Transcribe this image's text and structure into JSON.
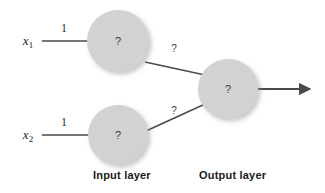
{
  "diagram": {
    "type": "neural-network",
    "background_color": "#ffffff",
    "node_fill_color": "#d2d2d2",
    "edge_color": "#4a4a4a",
    "text_color": "#1c1c1c",
    "inputs": [
      {
        "label": "x",
        "subscript": "1",
        "weight": "1"
      },
      {
        "label": "x",
        "subscript": "2",
        "weight": "1"
      }
    ],
    "input_layer": {
      "caption": "Input layer",
      "nodes": [
        {
          "id": "input-node-1",
          "value": "?",
          "cx": 118,
          "cy": 41,
          "r": 31
        },
        {
          "id": "input-node-2",
          "value": "?",
          "cx": 118,
          "cy": 135,
          "r": 30
        }
      ]
    },
    "output_layer": {
      "caption": "Output layer",
      "nodes": [
        {
          "id": "output-node-1",
          "value": "?",
          "cx": 228,
          "cy": 89,
          "r": 30
        }
      ]
    },
    "hidden_edges": [
      {
        "from": "input-node-1",
        "to": "output-node-1",
        "label": "?"
      },
      {
        "from": "input-node-2",
        "to": "output-node-1",
        "label": "?"
      }
    ],
    "output_arrow": {
      "from_x": 258,
      "to_x": 315,
      "y": 89
    }
  }
}
